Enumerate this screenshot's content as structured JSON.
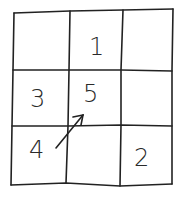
{
  "diagram": {
    "type": "3x3 grid puzzle (hand-drawn)",
    "rows": 3,
    "cols": 3,
    "cells": [
      [
        "",
        "1",
        ""
      ],
      [
        "3",
        "5",
        ""
      ],
      [
        "4",
        "",
        "2"
      ]
    ],
    "arrow": {
      "from": "row3-col1 (4)",
      "to": "row2-col2 (5)",
      "direction": "up-right"
    },
    "stroke_color": "#222222"
  }
}
